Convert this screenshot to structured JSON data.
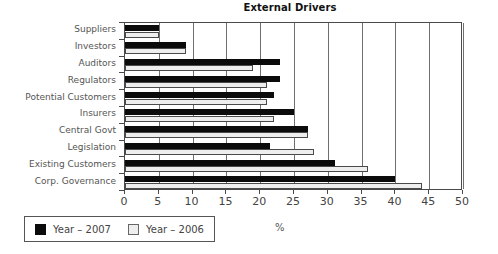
{
  "chart_data": {
    "type": "bar",
    "orientation": "horizontal",
    "title": "External Drivers",
    "xlabel": "%",
    "ylabel": "",
    "xlim": [
      0,
      50
    ],
    "ylim": null,
    "grid": true,
    "grid_axis": "x",
    "legend_position": "below-left",
    "xticks": [
      0,
      5,
      10,
      15,
      20,
      25,
      30,
      35,
      40,
      45,
      50
    ],
    "xticklabels": [
      "0",
      "5",
      "10",
      "15",
      "20",
      "25",
      "30",
      "35",
      "40",
      "45",
      "50"
    ],
    "categories": [
      "Suppliers",
      "Investors",
      "Auditors",
      "Regulators",
      "Potential Customers",
      "Insurers",
      "Central Govt",
      "Legislation",
      "Existing Customers",
      "Corp. Governance"
    ],
    "series": [
      {
        "name": "Year – 2007",
        "color": "#0b0b0b",
        "values": [
          5,
          9,
          23,
          23,
          22,
          25,
          27,
          21.5,
          31,
          40
        ]
      },
      {
        "name": "Year – 2006",
        "color": "#eeeeee",
        "values": [
          5,
          9,
          19,
          21,
          21,
          22,
          27,
          28,
          36,
          44
        ]
      }
    ]
  },
  "legend": {
    "entries": [
      {
        "label": "Year – 2007",
        "swatch": "black-square-swatch"
      },
      {
        "label": "Year – 2006",
        "swatch": "white-square-swatch"
      }
    ]
  },
  "colors": {
    "series_2007": "#0b0b0b",
    "series_2006": "#eeeeee",
    "axis": "#4a4a4a",
    "gridline": "#6f6f6f",
    "text": "#555555",
    "title_text": "#111111",
    "background": "#ffffff"
  }
}
